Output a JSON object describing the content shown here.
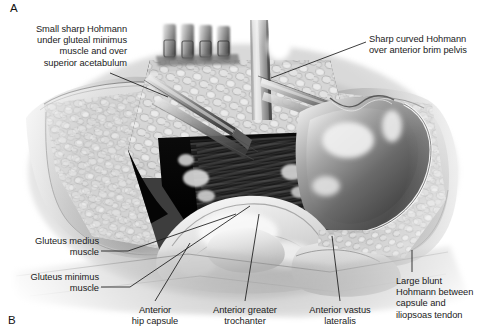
{
  "figure": {
    "background_color": "#ffffff",
    "ink_color": "#1b1b1b",
    "width": 486,
    "height": 336
  },
  "panels": [
    {
      "id": "panel-a",
      "letter": "A"
    },
    {
      "id": "panel-b",
      "letter": "B"
    }
  ],
  "annotations": [
    {
      "id": "small-sharp-hohmann",
      "text": "Small sharp Hohmann\nunder gluteal minimus\nmuscle and over\nsuperior acetabulum",
      "align": "right",
      "leader": {
        "from_x": 110,
        "from_y": 73,
        "to_x": 168,
        "to_y": 97
      }
    },
    {
      "id": "sharp-curved-hohmann",
      "text": "Sharp curved Hohmann\nover anterior brim pelvis",
      "align": "left",
      "leader": {
        "from_x": 366,
        "from_y": 42,
        "to_x": 271,
        "to_y": 78
      }
    },
    {
      "id": "gluteus-medius-muscle",
      "text": "Gluteus medius\nmuscle",
      "align": "right",
      "leader": {
        "from_x": 101,
        "top_y": 253,
        "to_x": 232,
        "to_y": 218
      }
    },
    {
      "id": "gluteus-minimus-muscle",
      "text": "Gluteus minimus\nmuscle",
      "align": "right",
      "leader": {
        "from_x": 101,
        "top_y": 289,
        "to_x": 246,
        "to_y": 210
      }
    },
    {
      "id": "anterior-hip-capsule",
      "text": "Anterior\nhip capsule",
      "align": "center",
      "leader": {
        "from_x": 155,
        "from_y": 302,
        "to_x": 188,
        "to_y": 243
      }
    },
    {
      "id": "anterior-greater-trochanter",
      "text": "Anterior greater\ntrochanter",
      "align": "center",
      "leader": {
        "from_x": 245,
        "from_y": 302,
        "to_x": 258,
        "to_y": 215
      }
    },
    {
      "id": "anterior-vastus-lateralis",
      "text": "Anterior vastus\nlateralis",
      "align": "center",
      "leader": {
        "from_x": 340,
        "from_y": 302,
        "to_x": 333,
        "to_y": 235
      }
    },
    {
      "id": "large-blunt-hohmann",
      "text": "Large blunt\nHohmann between\ncapsule and\niliopsoas tendon",
      "align": "left",
      "leader": {
        "from_x": 412,
        "from_y": 272,
        "to_x": 412,
        "to_y": 252
      }
    }
  ]
}
